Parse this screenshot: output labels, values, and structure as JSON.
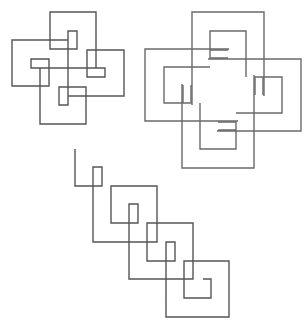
{
  "canvas": {
    "width": 307,
    "height": 325,
    "background": "#ffffff"
  },
  "colors": {
    "fig1": "#555555",
    "fig2": "#6a6a6a",
    "fig3": "#555555"
  },
  "figures": [
    {
      "id": "four-hook-knot-small",
      "description": "Small interlocking square spiral knot with 4-fold symmetry"
    },
    {
      "id": "four-hook-knot-large",
      "description": "Large interlocking nested square spiral knot with 4-fold symmetry"
    },
    {
      "id": "diagonal-spiral-chain",
      "description": "Diagonal chain of square spirals"
    }
  ]
}
